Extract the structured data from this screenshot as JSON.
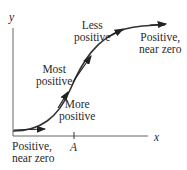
{
  "axes": {
    "x_label": "x",
    "y_label": "y",
    "tick_label": "A"
  },
  "annotations": {
    "start": [
      "Positive,",
      "near zero"
    ],
    "most": [
      "Most",
      "positive"
    ],
    "more": [
      "More",
      "positive"
    ],
    "less": [
      "Less",
      "positive"
    ],
    "end": [
      "Positive,",
      "near zero"
    ]
  },
  "colors": {
    "curve": "#333333",
    "axis": "#555555",
    "text": "#2a2a2a"
  }
}
